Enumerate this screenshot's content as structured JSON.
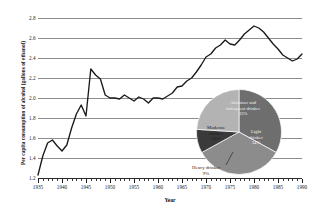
{
  "chart_data": [
    {
      "type": "line",
      "title": "",
      "xlabel": "Year",
      "ylabel": "Per capita consumption of alcohol (gallons of ethanol)",
      "xlim": [
        1935,
        1990
      ],
      "ylim": [
        1.2,
        2.8
      ],
      "ytick_labels": [
        "2.8",
        "2.6",
        "2.4",
        "2.2",
        "2.0",
        "1.8",
        "1.6",
        "1.4",
        "1.2"
      ],
      "ytick_values": [
        2.8,
        2.6,
        2.4,
        2.2,
        2.0,
        1.8,
        1.6,
        1.4,
        1.2
      ],
      "xtick_labels": [
        "1935",
        "1940",
        "1945",
        "1950",
        "1955",
        "1960",
        "1965",
        "1970",
        "1975",
        "1980",
        "1985",
        "1990"
      ],
      "xtick_values": [
        1935,
        1940,
        1945,
        1950,
        1955,
        1960,
        1965,
        1970,
        1975,
        1980,
        1985,
        1990
      ],
      "minor_tick_interval": 1,
      "grid": "horizontal",
      "legend": "none",
      "line_color": "#1a1a1a",
      "x": [
        1935,
        1936,
        1937,
        1938,
        1939,
        1940,
        1941,
        1942,
        1943,
        1944,
        1945,
        1946,
        1947,
        1948,
        1949,
        1950,
        1951,
        1952,
        1953,
        1954,
        1955,
        1956,
        1957,
        1958,
        1959,
        1960,
        1961,
        1962,
        1963,
        1964,
        1965,
        1966,
        1967,
        1968,
        1969,
        1970,
        1971,
        1972,
        1973,
        1974,
        1975,
        1976,
        1977,
        1978,
        1979,
        1980,
        1981,
        1982,
        1983,
        1984,
        1985,
        1986,
        1987,
        1988,
        1989,
        1990
      ],
      "values": [
        1.23,
        1.42,
        1.55,
        1.58,
        1.52,
        1.47,
        1.53,
        1.7,
        1.84,
        1.93,
        1.82,
        2.29,
        2.23,
        2.19,
        2.03,
        2.0,
        2.0,
        1.99,
        2.03,
        2.0,
        1.97,
        2.01,
        1.99,
        1.95,
        2.0,
        2.0,
        1.99,
        2.02,
        2.05,
        2.11,
        2.12,
        2.17,
        2.2,
        2.26,
        2.33,
        2.41,
        2.44,
        2.5,
        2.53,
        2.58,
        2.54,
        2.53,
        2.58,
        2.64,
        2.68,
        2.72,
        2.7,
        2.66,
        2.6,
        2.54,
        2.49,
        2.43,
        2.4,
        2.37,
        2.39,
        2.44
      ]
    },
    {
      "type": "pie",
      "title": "",
      "labels": [
        "Abstainer and infrequent drinker",
        "Light drinker",
        "Heavy drinker",
        "Moderate drinker"
      ],
      "values": [
        33,
        34,
        9,
        24
      ],
      "value_labels": [
        "33%",
        "34%",
        "9%",
        "24%"
      ],
      "colors": [
        "#6e6e6e",
        "#8c8c8c",
        "#3a3a3a",
        "#b3b3b3"
      ],
      "legend": "labels-on-slices"
    }
  ],
  "axis": {
    "y_title": "Per capita consumption of alcohol (gallons of ethanol)",
    "x_title": "Year"
  },
  "pie_labels": {
    "abstainer_name": "Abstainer and",
    "abstainer_name2": "infrequent drinker",
    "abstainer_pct": "33%",
    "light_name": "Light",
    "light_name2": "drinker",
    "light_pct": "34%",
    "moderate_name": "Moderate",
    "moderate_name2": "drinker",
    "moderate_pct": "24%",
    "heavy_name": "Heavy drinker",
    "heavy_pct": "9%"
  }
}
